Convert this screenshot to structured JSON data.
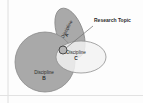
{
  "figure": {
    "background_color": "#fdfdfd"
  },
  "colors": {
    "discipline_fill": "#a9a9a9",
    "discipline_stroke": "#8a8a8a",
    "overlap_fill": "#f2f2f2",
    "overlap_stroke": "#8f8f8f",
    "topic_fill": "#b5b5b5",
    "topic_stroke": "#4a4a4a",
    "leader_line": "#6f6f6f",
    "text": "#2b2b2b",
    "rule": "#d6d6d6"
  },
  "shapes": {
    "discipline_a": {
      "label": "Discipline",
      "sublabel": "A",
      "cx": 70,
      "cy": 33,
      "rx": 13,
      "ry": 26,
      "rotation": -20
    },
    "discipline_b": {
      "label": "Discipline",
      "sublabel": "B",
      "cx": 45,
      "cy": 62,
      "r": 30
    },
    "discipline_c": {
      "label": "Discipline",
      "sublabel": "C",
      "cx": 81,
      "cy": 57,
      "rx": 25,
      "ry": 16
    },
    "research_topic": {
      "label": "Research Topic",
      "cx": 63,
      "cy": 50,
      "r": 4
    }
  },
  "annotation": {
    "callout_label": "Research Topic",
    "callout_x": 94,
    "callout_y": 21,
    "leader_from_x": 93,
    "leader_from_y": 26,
    "leader_to_x": 66,
    "leader_to_y": 48
  },
  "decorations": {
    "left_rule_x": 8,
    "bottom_rule_y": 95
  }
}
